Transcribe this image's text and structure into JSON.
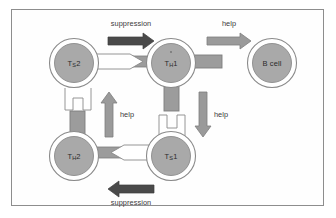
{
  "figure": {
    "background_color": "#fefefe",
    "frame_color": "#8d8d8d"
  },
  "palette": {
    "cell_fill": "#a9a9a9",
    "cell_outline": "#8a8a8a",
    "cell_ring": "#ffffff",
    "dark_arrow": "#4a4a4a",
    "light_arrow": "#9a9a9a",
    "receptor_fill": "#9c9c9c",
    "socket_fill": "#ffffff",
    "text_color": "#2b2b2b"
  },
  "cells": [
    {
      "id": "ts2",
      "name": "Ts2",
      "label_main": "T",
      "label_sub": "S",
      "label_tail": "2",
      "cx": 73,
      "cy": 62,
      "r": 24
    },
    {
      "id": "th1",
      "name": "TH1",
      "label_main": "T",
      "label_sub": "H",
      "label_tail": "1",
      "cx": 170,
      "cy": 62,
      "r": 24
    },
    {
      "id": "bcell",
      "name": "B cell",
      "label_main": "B cell",
      "label_sub": "",
      "label_tail": "",
      "cx": 271,
      "cy": 62,
      "r": 24
    },
    {
      "id": "th2",
      "name": "TH2",
      "label_main": "T",
      "label_sub": "H",
      "label_tail": "2",
      "cx": 73,
      "cy": 155,
      "r": 24
    },
    {
      "id": "ts1",
      "name": "Ts1",
      "label_main": "T",
      "label_sub": "S",
      "label_tail": "1",
      "cx": 170,
      "cy": 155,
      "r": 24
    }
  ],
  "edges": [
    {
      "id": "top-suppression",
      "label": "suppression",
      "from": "Ts2",
      "to": "TH1",
      "direction": "right",
      "arrow_style": "dark",
      "label_x": 122,
      "label_y": 20
    },
    {
      "id": "top-help",
      "label": "help",
      "from": "TH1",
      "to": "B cell",
      "direction": "right",
      "arrow_style": "light",
      "label_x": 220,
      "label_y": 20
    },
    {
      "id": "left-help",
      "label": "help",
      "from": "TH2",
      "to": "Ts2",
      "direction": "up",
      "arrow_style": "light",
      "label_x": 113,
      "label_y": 111
    },
    {
      "id": "right-help",
      "label": "help",
      "from": "TH1",
      "to": "Ts1",
      "direction": "down",
      "arrow_style": "light",
      "label_x": 207,
      "label_y": 111
    },
    {
      "id": "bottom-suppression",
      "label": "suppression",
      "from": "Ts1",
      "to": "TH2",
      "direction": "left",
      "arrow_style": "dark",
      "label_x": 122,
      "label_y": 199
    }
  ],
  "connectors": [
    {
      "id": "ts2-to-th1",
      "type": "key-into-receptor",
      "orientation": "horizontal-right"
    },
    {
      "id": "th1-to-bcell",
      "type": "receptor-stub",
      "orientation": "horizontal-right"
    },
    {
      "id": "ts2-socket-down",
      "type": "socket",
      "orientation": "vertical-down"
    },
    {
      "id": "th2-stub-up",
      "type": "receptor-stub",
      "orientation": "vertical-up"
    },
    {
      "id": "th1-stub-down",
      "type": "receptor-stub",
      "orientation": "vertical-down"
    },
    {
      "id": "ts1-socket-up",
      "type": "socket",
      "orientation": "vertical-up"
    },
    {
      "id": "ts1-to-th2",
      "type": "key-into-receptor",
      "orientation": "horizontal-left"
    }
  ]
}
